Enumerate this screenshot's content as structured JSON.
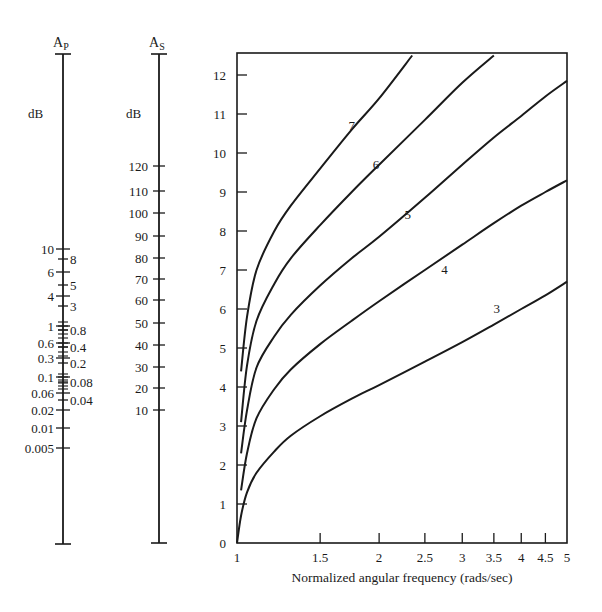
{
  "chart_data": {
    "type": "line",
    "title": "",
    "xlabel": "Normalized angular frequency (rads/sec)",
    "ylabel": "",
    "xscale": "log",
    "xlim": [
      1,
      5
    ],
    "ylim": [
      0,
      12.5
    ],
    "grid": false,
    "x_ticks": [
      "1",
      "1.5",
      "2",
      "2.5",
      "3",
      "3.5",
      "4",
      "4.5",
      "5"
    ],
    "x_tick_values": [
      1,
      1.5,
      2,
      2.5,
      3,
      3.5,
      4,
      4.5,
      5
    ],
    "y_ticks": [
      "0",
      "1",
      "2",
      "3",
      "4",
      "5",
      "6",
      "7",
      "8",
      "9",
      "10",
      "11",
      "12"
    ],
    "series": [
      {
        "name": "3",
        "x": [
          1.0,
          1.02,
          1.05,
          1.1,
          1.2,
          1.3,
          1.5,
          1.75,
          2.0,
          2.5,
          3.0,
          3.5,
          4.0,
          4.5,
          5.0
        ],
        "values": [
          0.0,
          0.7,
          1.3,
          1.8,
          2.35,
          2.75,
          3.25,
          3.7,
          4.05,
          4.65,
          5.15,
          5.6,
          6.0,
          6.35,
          6.7
        ]
      },
      {
        "name": "4",
        "x": [
          1.02,
          1.05,
          1.1,
          1.2,
          1.3,
          1.5,
          1.75,
          2.0,
          2.5,
          3.0,
          3.5,
          4.0,
          4.5,
          5.0
        ],
        "values": [
          1.35,
          2.3,
          3.2,
          3.95,
          4.45,
          5.1,
          5.7,
          6.2,
          7.0,
          7.65,
          8.2,
          8.65,
          9.0,
          9.3
        ]
      },
      {
        "name": "5",
        "x": [
          1.02,
          1.05,
          1.1,
          1.2,
          1.3,
          1.5,
          1.75,
          2.0,
          2.5,
          3.0,
          3.5,
          4.0,
          4.5,
          5.0
        ],
        "values": [
          2.3,
          3.4,
          4.5,
          5.3,
          5.85,
          6.6,
          7.3,
          7.85,
          8.85,
          9.7,
          10.4,
          10.95,
          11.45,
          11.85
        ]
      },
      {
        "name": "6",
        "x": [
          1.02,
          1.05,
          1.1,
          1.2,
          1.3,
          1.5,
          1.75,
          2.0,
          2.5,
          3.0,
          3.5
        ],
        "values": [
          3.1,
          4.55,
          5.7,
          6.65,
          7.3,
          8.15,
          9.0,
          9.7,
          10.85,
          11.8,
          12.5
        ]
      },
      {
        "name": "7",
        "x": [
          1.02,
          1.05,
          1.1,
          1.2,
          1.3,
          1.5,
          1.75,
          2.0,
          2.35
        ],
        "values": [
          4.4,
          5.8,
          7.0,
          8.0,
          8.65,
          9.6,
          10.6,
          11.4,
          12.5
        ]
      }
    ],
    "annotations": [
      {
        "text": "7",
        "x": 1.75,
        "y": 10.6
      },
      {
        "text": "6",
        "x": 1.97,
        "y": 9.6
      },
      {
        "text": "5",
        "x": 2.3,
        "y": 8.3
      },
      {
        "text": "4",
        "x": 2.75,
        "y": 6.9
      },
      {
        "text": "3",
        "x": 3.55,
        "y": 5.9
      }
    ],
    "nomograph_axes": [
      {
        "name": "A_P",
        "unit": "dB",
        "left_labels": [
          "10",
          "6",
          "4",
          "1",
          "0.6",
          "0.3",
          "0.1",
          "0.06",
          "0.02",
          "0.01",
          "0.005"
        ],
        "right_labels": [
          "8",
          "5",
          "3",
          "0.8",
          "0.4",
          "0.2",
          "0.08",
          "0.04"
        ]
      },
      {
        "name": "A_S",
        "unit": "dB",
        "labels": [
          "120",
          "110",
          "100",
          "90",
          "80",
          "70",
          "60",
          "50",
          "40",
          "30",
          "20",
          "10"
        ]
      }
    ]
  },
  "ap_axis": {
    "title_main": "A",
    "title_sub": "P",
    "unit": "dB",
    "left_ticks": [
      {
        "label": "10",
        "y": 249
      },
      {
        "label": "6",
        "y": 272
      },
      {
        "label": "4",
        "y": 296
      },
      {
        "label": "1",
        "y": 326
      },
      {
        "label": "0.6",
        "y": 343
      },
      {
        "label": "0.3",
        "y": 358
      },
      {
        "label": "0.1",
        "y": 377
      },
      {
        "label": "0.06",
        "y": 393
      },
      {
        "label": "0.02",
        "y": 410
      },
      {
        "label": "0.01",
        "y": 428
      },
      {
        "label": "0.005",
        "y": 448
      }
    ],
    "right_ticks": [
      {
        "label": "8",
        "y": 259
      },
      {
        "label": "5",
        "y": 285
      },
      {
        "label": "3",
        "y": 306
      },
      {
        "label": "0.8",
        "y": 330
      },
      {
        "label": "0.4",
        "y": 347
      },
      {
        "label": "0.2",
        "y": 363
      },
      {
        "label": "0.08",
        "y": 382
      },
      {
        "label": "0.04",
        "y": 400
      }
    ],
    "minor_ticks_y": [
      322,
      326,
      330,
      334,
      338,
      343,
      347,
      352,
      356,
      374,
      377,
      380,
      383,
      386,
      389
    ]
  },
  "as_axis": {
    "title_main": "A",
    "title_sub": "S",
    "unit": "dB",
    "ticks": [
      {
        "label": "120",
        "y": 166
      },
      {
        "label": "110",
        "y": 191
      },
      {
        "label": "100",
        "y": 213
      },
      {
        "label": "90",
        "y": 236
      },
      {
        "label": "80",
        "y": 258
      },
      {
        "label": "70",
        "y": 279
      },
      {
        "label": "60",
        "y": 300
      },
      {
        "label": "50",
        "y": 323
      },
      {
        "label": "40",
        "y": 345
      },
      {
        "label": "30",
        "y": 367
      },
      {
        "label": "20",
        "y": 388
      },
      {
        "label": "10",
        "y": 410
      }
    ]
  }
}
